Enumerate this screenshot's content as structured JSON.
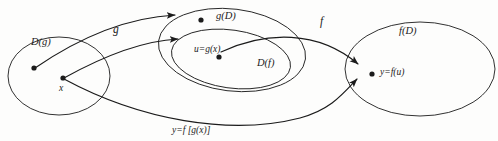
{
  "figure": {
    "kind": "function-composition-mapping-diagram",
    "background_color": "#fdfdfc",
    "stroke_color": "#1b1b1b"
  },
  "sets": {
    "domain_g": {
      "label": "D(g)",
      "cx": 59,
      "cy": 76,
      "rx": 51,
      "ry": 39
    },
    "image_g": {
      "label": "g(D)",
      "cx": 232,
      "cy": 50,
      "rx": 74,
      "ry": 41
    },
    "domain_f": {
      "label": "D(f)",
      "cx": 231,
      "cy": 59,
      "rx": 60,
      "ry": 29
    },
    "image_f": {
      "label": "f(D)",
      "cx": 420,
      "cy": 69,
      "rx": 75,
      "ry": 47
    }
  },
  "points": [
    {
      "name": "point-domain-g",
      "label": "",
      "x": 34,
      "y": 68
    },
    {
      "name": "point-x",
      "label": "x",
      "x": 63,
      "y": 78
    },
    {
      "name": "point-image-g",
      "label": "",
      "x": 201,
      "y": 20
    },
    {
      "name": "point-u",
      "label": "u=g(x)",
      "x": 219,
      "y": 57
    },
    {
      "name": "point-y",
      "label": "y=f(u)",
      "x": 372,
      "y": 74
    }
  ],
  "point_labels": {
    "x": "x",
    "u": "u=g(x)",
    "y": "y=f(u)"
  },
  "arrows": [
    {
      "name": "arrow-g-outer",
      "label": "g",
      "from": "point-domain-g",
      "to": "point-image-g"
    },
    {
      "name": "arrow-g-inner",
      "label": "",
      "from": "point-x",
      "to": "point-u"
    },
    {
      "name": "arrow-f",
      "label": "f",
      "from": "point-u",
      "to": "point-y"
    },
    {
      "name": "arrow-composite",
      "label": "y=f[g(x)]",
      "from": "point-x",
      "to": "point-y"
    }
  ],
  "arrow_labels": {
    "g": "g",
    "f": "f",
    "composite": "y=f [g(x)]"
  }
}
